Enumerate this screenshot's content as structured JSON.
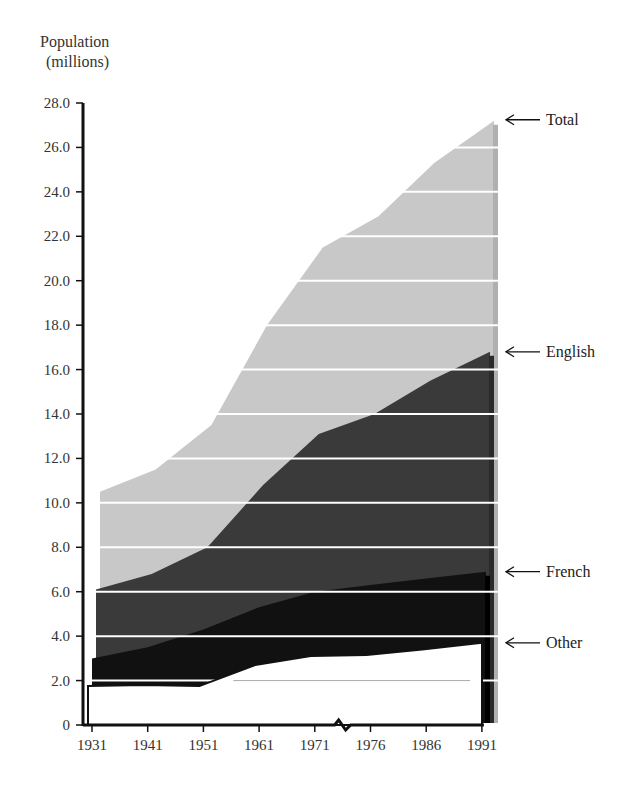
{
  "chart_data": {
    "type": "area",
    "stacked": true,
    "style": "layered-3d",
    "title": "",
    "ylabel_lines": [
      "Population",
      "(millions)"
    ],
    "xlabel": "",
    "ylim": [
      0,
      28
    ],
    "yticks": [
      0,
      2,
      4,
      6,
      8,
      10,
      12,
      14,
      16,
      18,
      20,
      22,
      24,
      26,
      28
    ],
    "ytick_labels": [
      "0",
      "2.0",
      "4.0",
      "6.0",
      "8.0",
      "10.0",
      "12.0",
      "14.0",
      "16.0",
      "18.0",
      "20.0",
      "22.0",
      "24.0",
      "26.0",
      "28.0"
    ],
    "categories": [
      "1931",
      "1941",
      "1951",
      "1961",
      "1971",
      "1976",
      "1986",
      "1991"
    ],
    "axis_break_between": [
      "1971",
      "1976"
    ],
    "grid": true,
    "grid_step": 2,
    "legend_placement": "right (arrow labels)",
    "series": [
      {
        "name": "Total",
        "label": "Total",
        "color": "#c8c8c8",
        "values": [
          10.5,
          11.5,
          13.5,
          18.0,
          21.5,
          22.9,
          25.3,
          27.2
        ]
      },
      {
        "name": "English",
        "label": "English",
        "color": "#3a3a3a",
        "values": [
          6.1,
          6.8,
          8.0,
          10.8,
          13.1,
          14.0,
          15.5,
          16.8
        ]
      },
      {
        "name": "French",
        "label": "French",
        "color": "#111111",
        "values": [
          3.0,
          3.5,
          4.3,
          5.3,
          6.0,
          6.3,
          6.6,
          6.9
        ]
      },
      {
        "name": "Other",
        "label": "Other",
        "color": "#ffffff",
        "values": [
          1.75,
          1.8,
          1.75,
          2.7,
          3.1,
          3.15,
          3.4,
          3.7
        ]
      }
    ]
  }
}
